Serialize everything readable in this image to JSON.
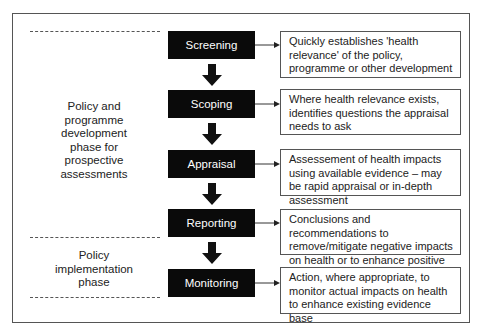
{
  "diagram": {
    "phases": [
      {
        "id": "development",
        "label": "Policy and programme development phase for prospective assessments",
        "lines": [
          "Policy and",
          "programme",
          "development",
          "phase for",
          "prospective",
          "assessments"
        ]
      },
      {
        "id": "implementation",
        "label": "Policy implementation phase",
        "lines": [
          "Policy",
          "implementation",
          "phase"
        ]
      }
    ],
    "stages": [
      {
        "label": "Screening",
        "description": "Quickly establishes 'health relevance' of the  policy, programme or other development"
      },
      {
        "label": "Scoping",
        "description": "Where health relevance exists, identifies questions the appraisal needs to ask"
      },
      {
        "label": "Appraisal",
        "description": "Assessement of health impacts using available evidence – may be rapid appraisal or in-depth assessment"
      },
      {
        "label": "Reporting",
        "description": "Conclusions and recommendations to remove/mitigate negative impacts on health or to enhance positive aspects"
      },
      {
        "label": "Monitoring",
        "description": "Action, where appropriate, to monitor actual impacts on health to enhance existing evidence base"
      }
    ],
    "colors": {
      "stage_fill": "#0a0a0a",
      "stage_text": "#ffffff",
      "border": "#555555"
    }
  }
}
